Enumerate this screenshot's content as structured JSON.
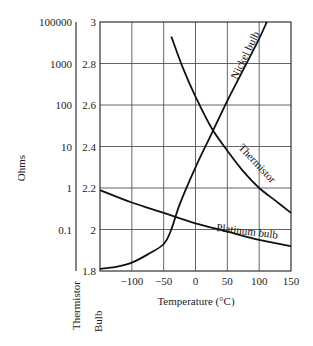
{
  "chart_data": {
    "type": "line",
    "title": "",
    "xlabel": "Temperature (°C)",
    "ylabel": "Ohms",
    "xlim": [
      -150,
      150
    ],
    "x_ticks": [
      "-100",
      "-50",
      "0",
      "50",
      "100",
      "150"
    ],
    "x_tick_values": [
      -100,
      -50,
      0,
      50,
      100,
      150
    ],
    "grid": true,
    "y_axes": [
      {
        "name": "Thermistor",
        "scale": "log",
        "label": "Thermistor",
        "tick_labels": [
          "100000",
          "1000",
          "100",
          "10",
          "1",
          "0.1"
        ]
      },
      {
        "name": "Bulb",
        "scale": "linear",
        "label": "Bulb",
        "ylim": [
          1.8,
          3.0
        ],
        "tick_labels": [
          "3",
          "2.8",
          "2.6",
          "2.4",
          "2.2",
          "2",
          "1.8"
        ],
        "tick_values": [
          3.0,
          2.8,
          2.6,
          2.4,
          2.2,
          2.0,
          1.8
        ]
      }
    ],
    "series": [
      {
        "name": "Thermistor",
        "label": "Thermistor",
        "axis": "Thermistor (read on bulb-scale positions)",
        "x": [
          -38,
          -20,
          0,
          25,
          50,
          75,
          100,
          125,
          150
        ],
        "y": [
          2.93,
          2.78,
          2.64,
          2.49,
          2.38,
          2.28,
          2.2,
          2.14,
          2.08
        ]
      },
      {
        "name": "Nickel bulb",
        "label": "Nickel bulb",
        "axis": "Bulb",
        "x": [
          -150,
          -125,
          -100,
          -75,
          -50,
          -38,
          -25,
          0,
          25,
          50,
          75,
          100,
          112
        ],
        "y": [
          1.81,
          1.82,
          1.84,
          1.88,
          1.93,
          2.0,
          2.12,
          2.3,
          2.46,
          2.62,
          2.77,
          2.92,
          3.0
        ]
      },
      {
        "name": "Platinum bulb",
        "label": "Platinum bulb",
        "axis": "Bulb",
        "x": [
          -150,
          -100,
          -50,
          0,
          50,
          100,
          150
        ],
        "y": [
          2.19,
          2.13,
          2.08,
          2.03,
          1.99,
          1.95,
          1.92
        ]
      }
    ],
    "legend": "inline labels along curves"
  },
  "labels": {
    "ohms": "Ohms",
    "thermistor_axis": "Thermistor",
    "bulb_axis": "Bulb",
    "xlabel": "Temperature (°C)",
    "nickel": "Nickel bulb",
    "thermistor": "Thermistor",
    "platinum": "Platinum bulb"
  }
}
